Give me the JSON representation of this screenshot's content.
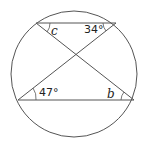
{
  "diagram": {
    "type": "circle-geometry",
    "colors": {
      "stroke": "#555555",
      "text": "#222222",
      "background": "#ffffff"
    },
    "labels": {
      "c": "c",
      "top_right": "34°",
      "bottom_left": "47°",
      "b": "b"
    }
  }
}
